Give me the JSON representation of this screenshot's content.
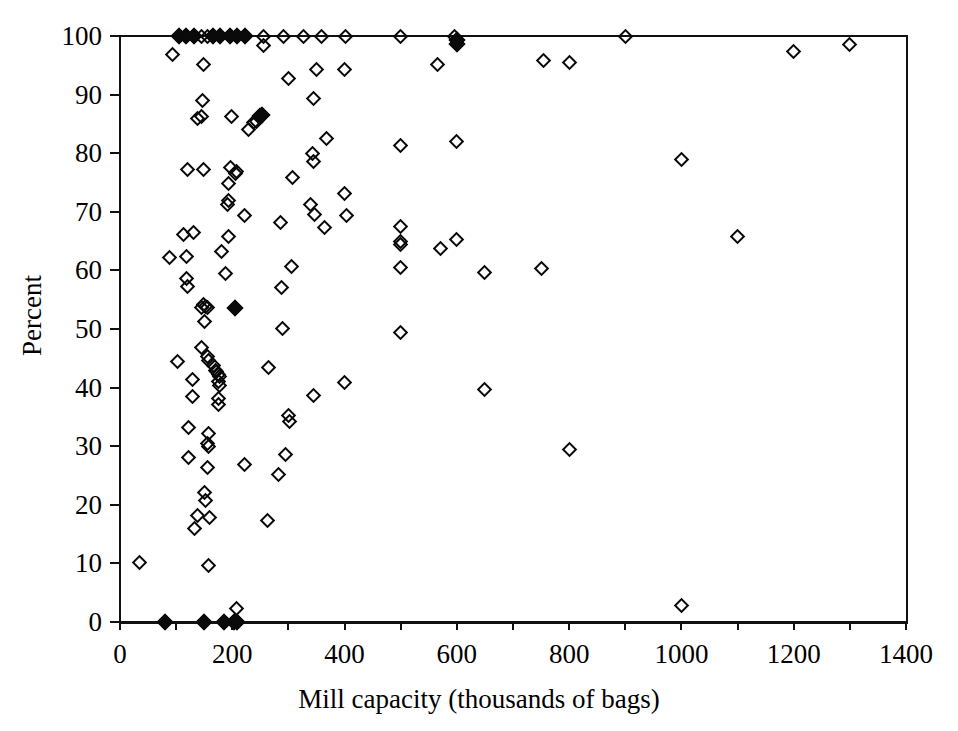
{
  "chart_data": {
    "type": "scatter",
    "title": "",
    "xlabel": "Mill capacity (thousands of bags)",
    "ylabel": "Percent",
    "xlim": [
      0,
      1400
    ],
    "ylim": [
      0,
      100
    ],
    "xticks": [
      0,
      200,
      400,
      600,
      800,
      1000,
      1200,
      1400
    ],
    "xtick_labels": [
      "0",
      "200",
      "400",
      "600",
      "800",
      "1000",
      "1200",
      "1400"
    ],
    "xminor_step": 100,
    "yticks": [
      0,
      10,
      20,
      30,
      40,
      50,
      60,
      70,
      80,
      90,
      100
    ],
    "ytick_labels": [
      "0",
      "10",
      "20",
      "30",
      "40",
      "50",
      "60",
      "70",
      "80",
      "90",
      "100"
    ],
    "grid": false,
    "legend": null,
    "marker": "diamond",
    "marker_color": "#0a0a0a",
    "point_count": 162,
    "points": [
      {
        "x": 105,
        "y": 100,
        "filled": true
      },
      {
        "x": 118,
        "y": 100,
        "filled": true
      },
      {
        "x": 132,
        "y": 100,
        "filled": true
      },
      {
        "x": 145,
        "y": 100,
        "filled": false
      },
      {
        "x": 155,
        "y": 100,
        "filled": false
      },
      {
        "x": 166,
        "y": 100,
        "filled": true
      },
      {
        "x": 178,
        "y": 100,
        "filled": true
      },
      {
        "x": 196,
        "y": 100,
        "filled": true
      },
      {
        "x": 208,
        "y": 100,
        "filled": true
      },
      {
        "x": 222,
        "y": 100,
        "filled": true
      },
      {
        "x": 256,
        "y": 100,
        "filled": false
      },
      {
        "x": 291,
        "y": 100,
        "filled": false
      },
      {
        "x": 326,
        "y": 100,
        "filled": false
      },
      {
        "x": 359,
        "y": 100,
        "filled": false
      },
      {
        "x": 402,
        "y": 100,
        "filled": false
      },
      {
        "x": 500,
        "y": 100,
        "filled": false
      },
      {
        "x": 595,
        "y": 100,
        "filled": false
      },
      {
        "x": 600,
        "y": 99.3,
        "filled": true
      },
      {
        "x": 600,
        "y": 98.6,
        "filled": true
      },
      {
        "x": 900,
        "y": 100,
        "filled": false
      },
      {
        "x": 256,
        "y": 98.3,
        "filled": false
      },
      {
        "x": 1300,
        "y": 98.6,
        "filled": false
      },
      {
        "x": 1200,
        "y": 97.4,
        "filled": false
      },
      {
        "x": 94,
        "y": 96.9,
        "filled": false
      },
      {
        "x": 148,
        "y": 95.1,
        "filled": false
      },
      {
        "x": 565,
        "y": 95.2,
        "filled": false
      },
      {
        "x": 755,
        "y": 95.8,
        "filled": false
      },
      {
        "x": 800,
        "y": 95.4,
        "filled": false
      },
      {
        "x": 350,
        "y": 94.3,
        "filled": false
      },
      {
        "x": 400,
        "y": 94.2,
        "filled": false
      },
      {
        "x": 147,
        "y": 89.0,
        "filled": false
      },
      {
        "x": 345,
        "y": 89.3,
        "filled": false
      },
      {
        "x": 300,
        "y": 92.8,
        "filled": false
      },
      {
        "x": 138,
        "y": 86.0,
        "filled": false
      },
      {
        "x": 146,
        "y": 86.2,
        "filled": false
      },
      {
        "x": 198,
        "y": 86.3,
        "filled": false
      },
      {
        "x": 250,
        "y": 86.4,
        "filled": true
      },
      {
        "x": 253,
        "y": 86.5,
        "filled": true
      },
      {
        "x": 248,
        "y": 86.1,
        "filled": false
      },
      {
        "x": 238,
        "y": 85.2,
        "filled": false
      },
      {
        "x": 243,
        "y": 85.4,
        "filled": false
      },
      {
        "x": 228,
        "y": 84.0,
        "filled": false
      },
      {
        "x": 367,
        "y": 82.5,
        "filled": false
      },
      {
        "x": 500,
        "y": 81.3,
        "filled": false
      },
      {
        "x": 600,
        "y": 82.0,
        "filled": false
      },
      {
        "x": 1000,
        "y": 79.0,
        "filled": false
      },
      {
        "x": 343,
        "y": 80.0,
        "filled": false
      },
      {
        "x": 345,
        "y": 78.6,
        "filled": false
      },
      {
        "x": 120,
        "y": 77.3,
        "filled": false
      },
      {
        "x": 148,
        "y": 77.2,
        "filled": false
      },
      {
        "x": 196,
        "y": 77.5,
        "filled": false
      },
      {
        "x": 207,
        "y": 76.9,
        "filled": false
      },
      {
        "x": 205,
        "y": 76.5,
        "filled": false
      },
      {
        "x": 308,
        "y": 75.8,
        "filled": false
      },
      {
        "x": 193,
        "y": 74.8,
        "filled": false
      },
      {
        "x": 400,
        "y": 73.2,
        "filled": false
      },
      {
        "x": 193,
        "y": 72.0,
        "filled": false
      },
      {
        "x": 192,
        "y": 71.3,
        "filled": false
      },
      {
        "x": 339,
        "y": 71.2,
        "filled": false
      },
      {
        "x": 222,
        "y": 69.4,
        "filled": false
      },
      {
        "x": 347,
        "y": 69.6,
        "filled": false
      },
      {
        "x": 403,
        "y": 69.4,
        "filled": false
      },
      {
        "x": 286,
        "y": 68.2,
        "filled": false
      },
      {
        "x": 500,
        "y": 67.5,
        "filled": false
      },
      {
        "x": 365,
        "y": 67.4,
        "filled": false
      },
      {
        "x": 113,
        "y": 66.2,
        "filled": false
      },
      {
        "x": 131,
        "y": 66.4,
        "filled": false
      },
      {
        "x": 194,
        "y": 65.7,
        "filled": false
      },
      {
        "x": 500,
        "y": 65.0,
        "filled": false
      },
      {
        "x": 500,
        "y": 64.4,
        "filled": false
      },
      {
        "x": 600,
        "y": 65.3,
        "filled": false
      },
      {
        "x": 570,
        "y": 63.8,
        "filled": false
      },
      {
        "x": 1100,
        "y": 65.8,
        "filled": false
      },
      {
        "x": 180,
        "y": 63.3,
        "filled": false
      },
      {
        "x": 88,
        "y": 62.2,
        "filled": false
      },
      {
        "x": 118,
        "y": 62.3,
        "filled": false
      },
      {
        "x": 188,
        "y": 59.5,
        "filled": false
      },
      {
        "x": 500,
        "y": 60.5,
        "filled": false
      },
      {
        "x": 305,
        "y": 60.6,
        "filled": false
      },
      {
        "x": 650,
        "y": 59.6,
        "filled": false
      },
      {
        "x": 119,
        "y": 58.6,
        "filled": false
      },
      {
        "x": 120,
        "y": 57.3,
        "filled": false
      },
      {
        "x": 287,
        "y": 57.0,
        "filled": false
      },
      {
        "x": 750,
        "y": 60.3,
        "filled": false
      },
      {
        "x": 148,
        "y": 54.2,
        "filled": false
      },
      {
        "x": 152,
        "y": 53.9,
        "filled": false
      },
      {
        "x": 156,
        "y": 53.7,
        "filled": false
      },
      {
        "x": 145,
        "y": 53.6,
        "filled": false
      },
      {
        "x": 205,
        "y": 53.6,
        "filled": true
      },
      {
        "x": 151,
        "y": 51.2,
        "filled": false
      },
      {
        "x": 290,
        "y": 50.1,
        "filled": false
      },
      {
        "x": 500,
        "y": 49.4,
        "filled": false
      },
      {
        "x": 146,
        "y": 46.8,
        "filled": false
      },
      {
        "x": 155,
        "y": 45.3,
        "filled": false
      },
      {
        "x": 158,
        "y": 44.6,
        "filled": false
      },
      {
        "x": 103,
        "y": 44.5,
        "filled": false
      },
      {
        "x": 166,
        "y": 43.8,
        "filled": false
      },
      {
        "x": 170,
        "y": 43.0,
        "filled": false
      },
      {
        "x": 172,
        "y": 42.7,
        "filled": false
      },
      {
        "x": 175,
        "y": 42.2,
        "filled": false
      },
      {
        "x": 178,
        "y": 41.9,
        "filled": false
      },
      {
        "x": 265,
        "y": 43.4,
        "filled": false
      },
      {
        "x": 130,
        "y": 41.4,
        "filled": false
      },
      {
        "x": 175,
        "y": 41.1,
        "filled": false
      },
      {
        "x": 178,
        "y": 40.3,
        "filled": false
      },
      {
        "x": 400,
        "y": 40.8,
        "filled": false
      },
      {
        "x": 650,
        "y": 39.6,
        "filled": false
      },
      {
        "x": 130,
        "y": 38.4,
        "filled": false
      },
      {
        "x": 176,
        "y": 38.2,
        "filled": false
      },
      {
        "x": 176,
        "y": 37.1,
        "filled": false
      },
      {
        "x": 345,
        "y": 38.6,
        "filled": false
      },
      {
        "x": 300,
        "y": 35.3,
        "filled": false
      },
      {
        "x": 302,
        "y": 34.2,
        "filled": false
      },
      {
        "x": 122,
        "y": 33.2,
        "filled": false
      },
      {
        "x": 157,
        "y": 32.2,
        "filled": false
      },
      {
        "x": 155,
        "y": 30.5,
        "filled": false
      },
      {
        "x": 158,
        "y": 29.9,
        "filled": false
      },
      {
        "x": 295,
        "y": 28.5,
        "filled": false
      },
      {
        "x": 800,
        "y": 29.4,
        "filled": false
      },
      {
        "x": 122,
        "y": 28.0,
        "filled": false
      },
      {
        "x": 155,
        "y": 26.4,
        "filled": false
      },
      {
        "x": 222,
        "y": 26.8,
        "filled": false
      },
      {
        "x": 283,
        "y": 25.2,
        "filled": false
      },
      {
        "x": 150,
        "y": 22.1,
        "filled": false
      },
      {
        "x": 152,
        "y": 20.7,
        "filled": false
      },
      {
        "x": 138,
        "y": 18.1,
        "filled": false
      },
      {
        "x": 160,
        "y": 17.9,
        "filled": false
      },
      {
        "x": 132,
        "y": 16.0,
        "filled": false
      },
      {
        "x": 262,
        "y": 17.3,
        "filled": false
      },
      {
        "x": 158,
        "y": 9.6,
        "filled": false
      },
      {
        "x": 35,
        "y": 10.2,
        "filled": false
      },
      {
        "x": 1000,
        "y": 2.9,
        "filled": false
      },
      {
        "x": 208,
        "y": 2.3,
        "filled": false
      },
      {
        "x": 80,
        "y": 0,
        "filled": true
      },
      {
        "x": 150,
        "y": 0,
        "filled": true
      },
      {
        "x": 186,
        "y": 0,
        "filled": true
      },
      {
        "x": 203,
        "y": 0,
        "filled": true
      },
      {
        "x": 208,
        "y": 0,
        "filled": true
      }
    ]
  }
}
